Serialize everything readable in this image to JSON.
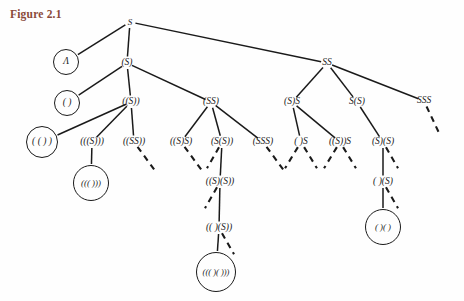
{
  "figure": {
    "title": "Figure 2.1",
    "title_color": "#8a4a3a",
    "width": 464,
    "height": 301,
    "background": "#ffffff",
    "ink_color": "#1a1a1a"
  },
  "tree": {
    "root_label": "S",
    "nodes": [
      {
        "id": "n0",
        "label": "S",
        "x": 130,
        "y": 22,
        "circled": false,
        "terminal": false,
        "level": 0
      },
      {
        "id": "n1",
        "label": "Λ",
        "x": 66,
        "y": 62,
        "circled": true,
        "terminal": true,
        "level": 1,
        "r": 13
      },
      {
        "id": "n2",
        "label": "(S)",
        "x": 127,
        "y": 63,
        "circled": false,
        "terminal": false,
        "level": 1
      },
      {
        "id": "n3",
        "label": "SS",
        "x": 327,
        "y": 63,
        "circled": false,
        "terminal": false,
        "level": 1
      },
      {
        "id": "n4",
        "label": "( )",
        "x": 67,
        "y": 103,
        "circled": true,
        "terminal": true,
        "level": 2,
        "r": 13
      },
      {
        "id": "n5",
        "label": "((S))",
        "x": 131,
        "y": 102,
        "circled": false,
        "terminal": false,
        "level": 2
      },
      {
        "id": "n6",
        "label": "(SS)",
        "x": 211,
        "y": 102,
        "circled": false,
        "terminal": false,
        "level": 2
      },
      {
        "id": "n7",
        "label": "(S)S",
        "x": 292,
        "y": 102,
        "circled": false,
        "terminal": false,
        "level": 2
      },
      {
        "id": "n8",
        "label": "S(S)",
        "x": 357,
        "y": 102,
        "circled": false,
        "terminal": false,
        "level": 2
      },
      {
        "id": "n9",
        "label": "SSS",
        "x": 424,
        "y": 101,
        "circled": false,
        "terminal": false,
        "level": 2
      },
      {
        "id": "n10",
        "label": "( ( ) )",
        "x": 42,
        "y": 142,
        "circled": true,
        "terminal": true,
        "level": 3,
        "r": 16
      },
      {
        "id": "n11",
        "label": "(((S)))",
        "x": 92,
        "y": 142,
        "circled": false,
        "terminal": false,
        "level": 3
      },
      {
        "id": "n12",
        "label": "((SS))",
        "x": 134,
        "y": 142,
        "circled": false,
        "terminal": false,
        "level": 3
      },
      {
        "id": "n13",
        "label": "((S)S)",
        "x": 181,
        "y": 142,
        "circled": false,
        "terminal": false,
        "level": 3
      },
      {
        "id": "n14",
        "label": "(S(S))",
        "x": 222,
        "y": 142,
        "circled": false,
        "terminal": false,
        "level": 3
      },
      {
        "id": "n15",
        "label": "(SSS)",
        "x": 263,
        "y": 142,
        "circled": false,
        "terminal": false,
        "level": 3
      },
      {
        "id": "n16",
        "label": "( )S",
        "x": 301,
        "y": 142,
        "circled": false,
        "terminal": false,
        "level": 3
      },
      {
        "id": "n17",
        "label": "((S))S",
        "x": 340,
        "y": 142,
        "circled": false,
        "terminal": false,
        "level": 3
      },
      {
        "id": "n18",
        "label": "(S)(S)",
        "x": 383,
        "y": 142,
        "circled": false,
        "terminal": false,
        "level": 3
      },
      {
        "id": "n19",
        "label": "((( )))",
        "x": 91,
        "y": 183,
        "circled": true,
        "terminal": true,
        "level": 4,
        "r": 18
      },
      {
        "id": "n20",
        "label": "((S)(S))",
        "x": 220,
        "y": 182,
        "circled": false,
        "terminal": false,
        "level": 4
      },
      {
        "id": "n21",
        "label": "( )(S)",
        "x": 383,
        "y": 182,
        "circled": false,
        "terminal": false,
        "level": 4
      },
      {
        "id": "n22",
        "label": "(( )(S))",
        "x": 219,
        "y": 228,
        "circled": false,
        "terminal": false,
        "level": 5
      },
      {
        "id": "n23",
        "label": "( )( )",
        "x": 383,
        "y": 227,
        "circled": true,
        "terminal": true,
        "level": 5,
        "r": 18
      },
      {
        "id": "n24",
        "label": "((( )( )))",
        "x": 216,
        "y": 272,
        "circled": true,
        "terminal": true,
        "level": 6,
        "r": 20
      }
    ],
    "edges": [
      {
        "from": "n0",
        "to": "n1",
        "style": "solid"
      },
      {
        "from": "n0",
        "to": "n2",
        "style": "solid"
      },
      {
        "from": "n0",
        "to": "n3",
        "style": "solid"
      },
      {
        "from": "n2",
        "to": "n4",
        "style": "solid"
      },
      {
        "from": "n2",
        "to": "n5",
        "style": "solid"
      },
      {
        "from": "n2",
        "to": "n6",
        "style": "solid"
      },
      {
        "from": "n3",
        "to": "n7",
        "style": "solid"
      },
      {
        "from": "n3",
        "to": "n8",
        "style": "solid"
      },
      {
        "from": "n3",
        "to": "n9",
        "style": "solid"
      },
      {
        "from": "n5",
        "to": "n10",
        "style": "solid"
      },
      {
        "from": "n5",
        "to": "n11",
        "style": "solid"
      },
      {
        "from": "n5",
        "to": "n12",
        "style": "solid"
      },
      {
        "from": "n6",
        "to": "n13",
        "style": "solid"
      },
      {
        "from": "n6",
        "to": "n14",
        "style": "solid"
      },
      {
        "from": "n6",
        "to": "n15",
        "style": "solid"
      },
      {
        "from": "n7",
        "to": "n16",
        "style": "solid"
      },
      {
        "from": "n7",
        "to": "n17",
        "style": "solid"
      },
      {
        "from": "n8",
        "to": "n18",
        "style": "solid"
      },
      {
        "from": "n11",
        "to": "n19",
        "style": "solid"
      },
      {
        "from": "n12",
        "to": "n19x",
        "style": "dashed",
        "dx": 22,
        "dy": 30
      },
      {
        "from": "n13",
        "to": "n13x",
        "style": "dashed",
        "dx": 22,
        "dy": 30
      },
      {
        "from": "n15",
        "to": "n15x",
        "style": "dashed",
        "dx": 22,
        "dy": 30
      },
      {
        "from": "n9",
        "to": "n9x",
        "style": "dashed",
        "dx": 16,
        "dy": 34
      },
      {
        "from": "n16",
        "to": "n16a",
        "style": "dashed",
        "dx": -17,
        "dy": 28
      },
      {
        "from": "n16",
        "to": "n16b",
        "style": "dashed",
        "dx": 17,
        "dy": 28
      },
      {
        "from": "n17",
        "to": "n17a",
        "style": "dashed",
        "dx": -17,
        "dy": 28
      },
      {
        "from": "n17",
        "to": "n17b",
        "style": "dashed",
        "dx": 17,
        "dy": 28
      },
      {
        "from": "n14",
        "to": "n20",
        "style": "solid"
      },
      {
        "from": "n14",
        "to": "n20d",
        "style": "dashed",
        "dx": -16,
        "dy": 28
      },
      {
        "from": "n18",
        "to": "n21",
        "style": "solid"
      },
      {
        "from": "n18",
        "to": "n21d",
        "style": "dashed",
        "dx": 16,
        "dy": 28
      },
      {
        "from": "n20",
        "to": "n22",
        "style": "solid"
      },
      {
        "from": "n20",
        "to": "n22d",
        "style": "dashed",
        "dx": -16,
        "dy": 28
      },
      {
        "from": "n21",
        "to": "n23",
        "style": "solid"
      },
      {
        "from": "n21",
        "to": "n23d",
        "style": "dashed",
        "dx": 16,
        "dy": 28
      },
      {
        "from": "n22",
        "to": "n24",
        "style": "solid"
      },
      {
        "from": "n22",
        "to": "n24d",
        "style": "dashed",
        "dx": 16,
        "dy": 28
      }
    ]
  }
}
